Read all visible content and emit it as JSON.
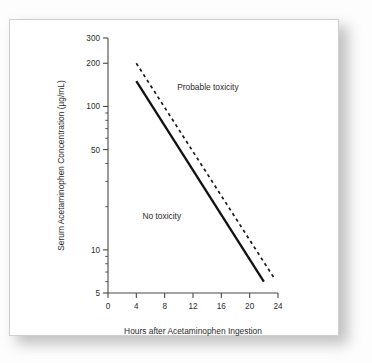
{
  "figure": {
    "background_color": "#ffffff",
    "frame_color": "#cfcfcf"
  },
  "chart_data": {
    "type": "line",
    "title": "",
    "subtitle": "",
    "xlabel": "Hours after Acetaminophen Ingestion",
    "ylabel": "Serum Acetaminophen Concentration (µg/mL)",
    "xscale": "linear",
    "yscale": "log",
    "xlim": [
      0,
      24
    ],
    "ylim": [
      5,
      300
    ],
    "grid": false,
    "legend_position": "none",
    "xticks": [
      0,
      4,
      8,
      12,
      16,
      20,
      24
    ],
    "xtick_labels": [
      "0",
      "4",
      "8",
      "12",
      "16",
      "20",
      "24"
    ],
    "yticks": [
      5,
      10,
      50,
      100,
      200,
      300
    ],
    "ytick_labels": [
      "5",
      "10",
      "50",
      "100",
      "200",
      "300"
    ],
    "yminor_ticks": [
      6,
      7,
      8,
      9,
      20,
      30,
      40,
      60,
      70,
      80,
      90
    ],
    "series": [
      {
        "name": "Probable hepatic toxicity line (upper, dashed)",
        "style": "dashed",
        "color": "#1a1a1a",
        "x": [
          4,
          23.5
        ],
        "y": [
          200,
          6.3
        ]
      },
      {
        "name": "Treatment threshold line (lower, solid)",
        "style": "solid",
        "color": "#111111",
        "x": [
          4,
          22
        ],
        "y": [
          150,
          6.0
        ]
      }
    ],
    "annotations": [
      {
        "text": "Probable toxicity",
        "x": 14.1,
        "y": 130
      },
      {
        "text": "No toxicity",
        "x": 7.6,
        "y": 16.5
      }
    ]
  }
}
